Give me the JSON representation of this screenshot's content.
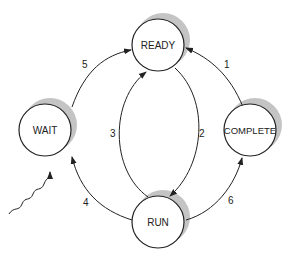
{
  "diagram": {
    "type": "state-transition",
    "states": [
      {
        "id": "ready",
        "label": "READY",
        "cx": 158,
        "cy": 45
      },
      {
        "id": "wait",
        "label": "WAIT",
        "cx": 45,
        "cy": 130
      },
      {
        "id": "complete",
        "label": "COMPLETE",
        "cx": 250,
        "cy": 130
      },
      {
        "id": "run",
        "label": "RUN",
        "cx": 158,
        "cy": 222
      }
    ],
    "transitions": [
      {
        "id": "t1",
        "label": "1",
        "from": "COMPLETE",
        "to": "READY"
      },
      {
        "id": "t2",
        "label": "2",
        "from": "READY",
        "to": "RUN"
      },
      {
        "id": "t3",
        "label": "3",
        "from": "RUN",
        "to": "READY"
      },
      {
        "id": "t4",
        "label": "4",
        "from": "RUN",
        "to": "WAIT"
      },
      {
        "id": "t5",
        "label": "5",
        "from": "WAIT",
        "to": "READY"
      },
      {
        "id": "t6",
        "label": "6",
        "from": "RUN",
        "to": "COMPLETE"
      }
    ],
    "external_event": {
      "target": "WAIT",
      "style": "wavy-arrow"
    },
    "colors": {
      "stroke": "#222222",
      "shadow": "#bdbdbd",
      "fill": "#ffffff"
    }
  }
}
